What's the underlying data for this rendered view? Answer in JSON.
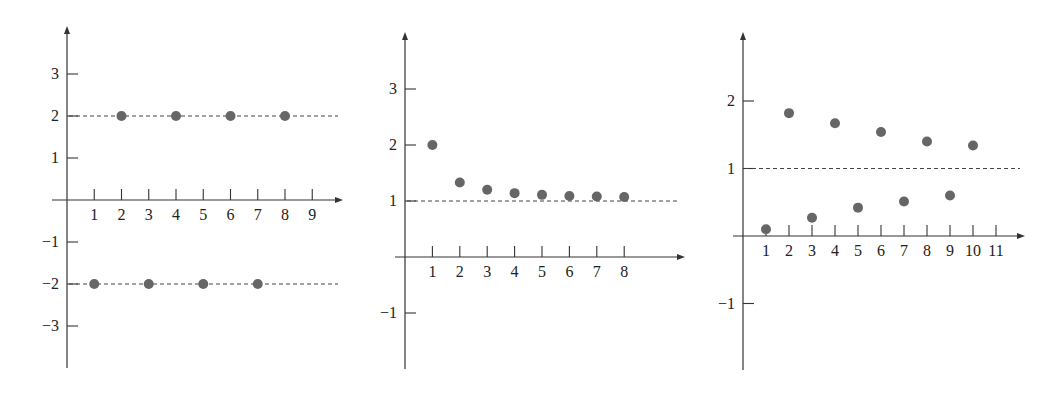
{
  "charts": [
    {
      "name": "chart-alternating",
      "axis": {
        "originX": 67,
        "originY": 200,
        "xStep": 27.25,
        "yStep": 42,
        "xMin": 52,
        "xMax": 343,
        "yTop": 26,
        "yBottom": 368
      },
      "xticks": [
        "1",
        "2",
        "3",
        "4",
        "5",
        "6",
        "7",
        "8",
        "9"
      ],
      "yticks": [
        {
          "v": 3,
          "label": "3"
        },
        {
          "v": 2,
          "label": "2"
        },
        {
          "v": 1,
          "label": "1"
        },
        {
          "v": -1,
          "label": "−1"
        },
        {
          "v": -2,
          "label": "−2"
        },
        {
          "v": -3,
          "label": "−3"
        }
      ],
      "dashed": [
        2,
        -2
      ],
      "dashXMax": 338,
      "points": [
        [
          1,
          -2
        ],
        [
          2,
          2
        ],
        [
          3,
          -2
        ],
        [
          4,
          2
        ],
        [
          5,
          -2
        ],
        [
          6,
          2
        ],
        [
          7,
          -2
        ],
        [
          8,
          2
        ]
      ]
    },
    {
      "name": "chart-decreasing",
      "axis": {
        "originX": 405,
        "originY": 257,
        "xStep": 27.4,
        "yStep": 56,
        "xMin": 395,
        "xMax": 685,
        "yTop": 32,
        "yBottom": 369
      },
      "xticks": [
        "1",
        "2",
        "3",
        "4",
        "5",
        "6",
        "7",
        "8"
      ],
      "yticks": [
        {
          "v": 3,
          "label": "3"
        },
        {
          "v": 2,
          "label": "2"
        },
        {
          "v": 1,
          "label": "1"
        },
        {
          "v": -1,
          "label": "−1"
        }
      ],
      "dashed": [
        1
      ],
      "dashXMax": 678,
      "points": [
        [
          1,
          2
        ],
        [
          2,
          1.33
        ],
        [
          3,
          1.2
        ],
        [
          4,
          1.14
        ],
        [
          5,
          1.11
        ],
        [
          6,
          1.09
        ],
        [
          7,
          1.08
        ],
        [
          8,
          1.07
        ]
      ]
    },
    {
      "name": "chart-oscillating",
      "axis": {
        "originX": 743,
        "originY": 236,
        "xStep": 23,
        "yStep": 67.5,
        "xMin": 733,
        "xMax": 1025,
        "yTop": 32,
        "yBottom": 370
      },
      "xticks": [
        "1",
        "2",
        "3",
        "4",
        "5",
        "6",
        "7",
        "8",
        "9",
        "10",
        "11"
      ],
      "yticks": [
        {
          "v": 2,
          "label": "2"
        },
        {
          "v": 1,
          "label": "1"
        },
        {
          "v": -1,
          "label": "−1"
        }
      ],
      "dashed": [
        1
      ],
      "dashXMax": 1020,
      "points": [
        [
          1,
          0.1
        ],
        [
          2,
          1.82
        ],
        [
          3,
          0.27
        ],
        [
          4,
          1.67
        ],
        [
          5,
          0.42
        ],
        [
          6,
          1.54
        ],
        [
          7,
          0.51
        ],
        [
          8,
          1.4
        ],
        [
          9,
          0.6
        ],
        [
          10,
          1.34
        ]
      ]
    }
  ],
  "chart_data": [
    {
      "type": "scatter",
      "title": "",
      "xlabel": "",
      "ylabel": "",
      "x": [
        1,
        2,
        3,
        4,
        5,
        6,
        7,
        8
      ],
      "series": [
        {
          "name": "a_n",
          "values": [
            -2,
            2,
            -2,
            2,
            -2,
            2,
            -2,
            2
          ]
        }
      ],
      "reference_lines": [
        2,
        -2
      ],
      "xticks": [
        1,
        2,
        3,
        4,
        5,
        6,
        7,
        8,
        9
      ],
      "yticks": [
        -3,
        -2,
        -1,
        1,
        2,
        3
      ],
      "xlim": [
        0,
        10
      ],
      "ylim": [
        -4,
        4
      ],
      "grid": false,
      "legend": "none"
    },
    {
      "type": "scatter",
      "title": "",
      "xlabel": "",
      "ylabel": "",
      "x": [
        1,
        2,
        3,
        4,
        5,
        6,
        7,
        8
      ],
      "series": [
        {
          "name": "a_n",
          "values": [
            2,
            1.33,
            1.2,
            1.14,
            1.11,
            1.09,
            1.08,
            1.07
          ]
        }
      ],
      "reference_lines": [
        1
      ],
      "xticks": [
        1,
        2,
        3,
        4,
        5,
        6,
        7,
        8
      ],
      "yticks": [
        -1,
        1,
        2,
        3
      ],
      "xlim": [
        0,
        10
      ],
      "ylim": [
        -2,
        4
      ],
      "grid": false,
      "legend": "none"
    },
    {
      "type": "scatter",
      "title": "",
      "xlabel": "",
      "ylabel": "",
      "x": [
        1,
        2,
        3,
        4,
        5,
        6,
        7,
        8,
        9,
        10
      ],
      "series": [
        {
          "name": "a_n",
          "values": [
            0.1,
            1.82,
            0.27,
            1.67,
            0.42,
            1.54,
            0.51,
            1.4,
            0.6,
            1.34
          ]
        }
      ],
      "reference_lines": [
        1
      ],
      "xticks": [
        1,
        2,
        3,
        4,
        5,
        6,
        7,
        8,
        9,
        10,
        11
      ],
      "yticks": [
        -1,
        1,
        2
      ],
      "xlim": [
        0,
        12
      ],
      "ylim": [
        -2,
        3
      ],
      "grid": false,
      "legend": "none"
    }
  ]
}
